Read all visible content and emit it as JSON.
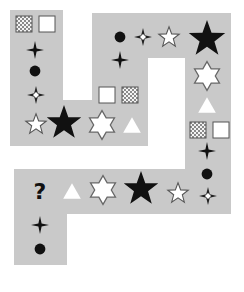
{
  "puzzle": {
    "type": "sequence-path",
    "missing_symbol": "?",
    "colors": {
      "path_fill": "#c9c9c9",
      "background": "#ffffff",
      "dark": "#111111",
      "outline": "#666666"
    },
    "sequence": [
      "checkered-square",
      "white-square",
      "black-four-point-star",
      "black-circle",
      "outlined-sparkle",
      "small-white-star",
      "large-black-star",
      "white-hexagram",
      "white-triangle",
      "white-square",
      "checkered-square",
      "black-four-point-star",
      "black-circle",
      "outlined-sparkle",
      "small-white-star",
      "large-black-star",
      "white-hexagram",
      "white-triangle",
      "checkered-square",
      "white-square",
      "black-four-point-star",
      "black-circle",
      "outlined-sparkle",
      "small-white-star",
      "large-black-star",
      "white-hexagram",
      "white-triangle",
      "?",
      "black-four-point-star",
      "black-circle"
    ]
  }
}
